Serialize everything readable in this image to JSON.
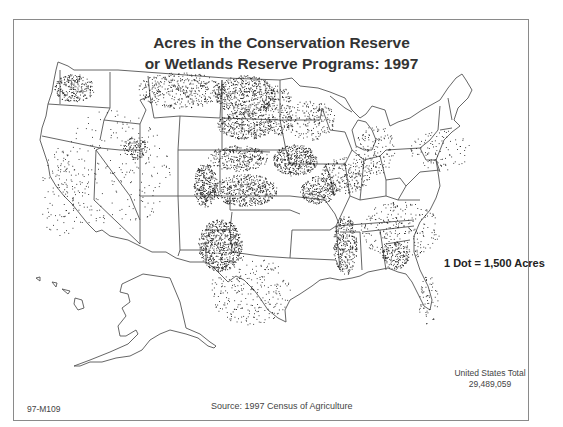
{
  "map": {
    "title_line1": "Acres in the Conservation Reserve",
    "title_line2": "or Wetlands Reserve Programs:  1997",
    "legend": "1 Dot = 1,500 Acres",
    "total_label": "United States Total",
    "total_value": "29,489,059",
    "map_code": "97-M109",
    "source": "Source:  1997 Census of Agriculture",
    "colors": {
      "outline": "#555555",
      "dot": "#1a1a1a",
      "frame": "#8a8a8a",
      "text": "#333333"
    },
    "density_regions": [
      {
        "name": "Washington east",
        "cx": 74,
        "cy": 88,
        "rx": 20,
        "ry": 14,
        "n": 260
      },
      {
        "name": "Idaho-Utah",
        "cx": 135,
        "cy": 148,
        "rx": 12,
        "ry": 12,
        "n": 120
      },
      {
        "name": "Montana north",
        "cx": 180,
        "cy": 90,
        "rx": 45,
        "ry": 18,
        "n": 420
      },
      {
        "name": "North Dakota",
        "cx": 245,
        "cy": 95,
        "rx": 30,
        "ry": 20,
        "n": 560
      },
      {
        "name": "South Dakota",
        "cx": 245,
        "cy": 125,
        "rx": 28,
        "ry": 14,
        "n": 360
      },
      {
        "name": "Minnesota west",
        "cx": 278,
        "cy": 110,
        "rx": 15,
        "ry": 25,
        "n": 200
      },
      {
        "name": "Nebraska",
        "cx": 238,
        "cy": 158,
        "rx": 30,
        "ry": 13,
        "n": 300
      },
      {
        "name": "Iowa",
        "cx": 295,
        "cy": 160,
        "rx": 22,
        "ry": 16,
        "n": 440
      },
      {
        "name": "Kansas",
        "cx": 245,
        "cy": 190,
        "rx": 32,
        "ry": 16,
        "n": 520
      },
      {
        "name": "Colorado east",
        "cx": 205,
        "cy": 185,
        "rx": 12,
        "ry": 22,
        "n": 340
      },
      {
        "name": "Oklahoma-TX panhandle",
        "cx": 220,
        "cy": 245,
        "rx": 22,
        "ry": 26,
        "n": 680
      },
      {
        "name": "Missouri north",
        "cx": 318,
        "cy": 190,
        "rx": 18,
        "ry": 14,
        "n": 260
      },
      {
        "name": "Mississippi delta",
        "cx": 345,
        "cy": 245,
        "rx": 12,
        "ry": 30,
        "n": 320
      },
      {
        "name": "Georgia",
        "cx": 395,
        "cy": 255,
        "rx": 14,
        "ry": 14,
        "n": 160
      },
      {
        "name": "Illinois-Indiana",
        "cx": 345,
        "cy": 175,
        "rx": 25,
        "ry": 18,
        "n": 240
      },
      {
        "name": "Ohio-Michigan",
        "cx": 375,
        "cy": 150,
        "rx": 20,
        "ry": 25,
        "n": 150
      },
      {
        "name": "Texas",
        "cx": 250,
        "cy": 290,
        "rx": 40,
        "ry": 35,
        "n": 260
      },
      {
        "name": "Southeast general",
        "cx": 400,
        "cy": 230,
        "rx": 40,
        "ry": 30,
        "n": 280
      },
      {
        "name": "Northeast",
        "cx": 440,
        "cy": 150,
        "rx": 30,
        "ry": 20,
        "n": 100
      },
      {
        "name": "West general",
        "cx": 110,
        "cy": 170,
        "rx": 60,
        "ry": 60,
        "n": 260
      },
      {
        "name": "California",
        "cx": 60,
        "cy": 195,
        "rx": 20,
        "ry": 45,
        "n": 90
      },
      {
        "name": "Florida",
        "cx": 428,
        "cy": 300,
        "rx": 10,
        "ry": 25,
        "n": 60
      },
      {
        "name": "Upper midwest",
        "cx": 310,
        "cy": 120,
        "rx": 25,
        "ry": 20,
        "n": 200
      }
    ]
  }
}
